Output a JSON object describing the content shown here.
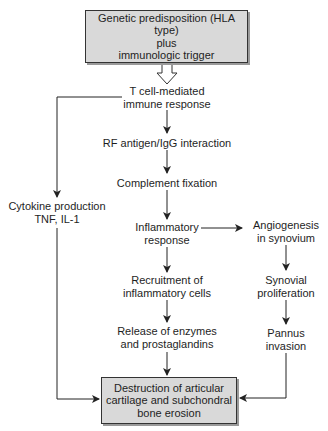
{
  "diagram": {
    "type": "flowchart",
    "topic": "Pathogenesis of rheumatoid arthritis",
    "nodes": {
      "start": {
        "lines": [
          "Genetic predisposition (HLA type)",
          "plus",
          "immunologic trigger"
        ]
      },
      "tcell": {
        "lines": [
          "T cell-mediated",
          "immune response"
        ]
      },
      "rf": {
        "lines": [
          "RF antigen/IgG interaction"
        ]
      },
      "complement": {
        "lines": [
          "Complement fixation"
        ]
      },
      "inflammatory": {
        "lines": [
          "Inflammatory",
          "response"
        ]
      },
      "recruitment": {
        "lines": [
          "Recruitment of",
          "inflammatory cells"
        ]
      },
      "release": {
        "lines": [
          "Release of enzymes",
          "and prostaglandins"
        ]
      },
      "cytokine": {
        "lines": [
          "Cytokine production",
          "TNF, IL-1"
        ]
      },
      "angiogenesis": {
        "lines": [
          "Angiogenesis",
          "in synovium"
        ]
      },
      "synovial": {
        "lines": [
          "Synovial",
          "proliferation"
        ]
      },
      "pannus": {
        "lines": [
          "Pannus",
          "invasion"
        ]
      },
      "end": {
        "lines": [
          "Destruction of articular",
          "cartilage and subchondral",
          "bone erosion"
        ]
      }
    },
    "edges": [
      {
        "from": "start",
        "to": "tcell",
        "style": "hollow-arrow"
      },
      {
        "from": "tcell",
        "to": "rf"
      },
      {
        "from": "rf",
        "to": "complement"
      },
      {
        "from": "complement",
        "to": "inflammatory"
      },
      {
        "from": "inflammatory",
        "to": "recruitment"
      },
      {
        "from": "recruitment",
        "to": "release"
      },
      {
        "from": "release",
        "to": "end"
      },
      {
        "from": "tcell",
        "to": "cytokine"
      },
      {
        "from": "cytokine",
        "to": "end"
      },
      {
        "from": "inflammatory",
        "to": "angiogenesis"
      },
      {
        "from": "angiogenesis",
        "to": "synovial"
      },
      {
        "from": "synovial",
        "to": "pannus"
      },
      {
        "from": "pannus",
        "to": "end"
      }
    ],
    "colors": {
      "box_fill": "#d9d9d9",
      "line": "#222222",
      "text": "#1e1e1e"
    }
  }
}
